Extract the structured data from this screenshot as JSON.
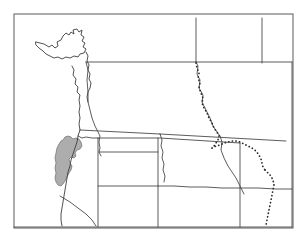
{
  "figure": {
    "kind": "range-map",
    "title": "",
    "caption": "",
    "background_color": "#ffffff",
    "frame": {
      "visible": true,
      "color": "#5a5a5a",
      "x": 14,
      "y": 14,
      "width": 279,
      "height": 214
    }
  },
  "legend": {
    "visible": false,
    "entries": [
      {
        "label": "",
        "symbol": "filled-polygon",
        "color": "#a9a9a9"
      },
      {
        "label": "",
        "symbol": "dotted-line",
        "color": "#2b2b2b"
      }
    ]
  },
  "map": {
    "region_name": "",
    "projection": "",
    "scale_bar": {
      "visible": false,
      "label": ""
    },
    "north_arrow": {
      "visible": false,
      "label": ""
    },
    "labels": [],
    "features": {
      "coastline": {
        "name": "coastline",
        "color": "#3d3d3d",
        "stroke_width": 0.9,
        "paths": [
          "M 36 42 L 44 44 L 49 47 L 52 45 L 55 48 L 58 46 L 57 42 L 61 40 L 63 36 L 66 33 L 69 35 L 71 32 L 74 34 L 73 30 L 77 29 L 79 32 L 82 30 L 81 35 L 84 37 L 82 41 L 85 43 L 83 47 L 86 49 L 84 53 L 80 54 L 78 57 L 74 56 L 70 58 L 66 57 L 62 59 L 58 57 L 54 58 L 50 56 L 46 54 L 43 51 L 39 48 L 36 45 Z",
          "M 72 66 L 74 70 L 73 75 L 76 79 L 75 84 L 78 87 L 77 92 L 80 95 L 79 100 L 80 106 L 79 112 L 80 118 L 79 124 L 80 130",
          "M 86 52 L 88 56 L 87 61 L 89 65 L 88 70 L 90 74 L 89 79 L 91 83 L 90 88 L 88 92 L 87 97 L 88 102",
          "M 80 130 L 78 136 L 77 142 L 75 148 L 73 154 L 71 160 L 70 166 L 68 172 L 67 178 L 66 184 L 65 190 L 64 196 L 63 202 L 62 208 L 61 214 L 61 220 L 62 226"
        ]
      },
      "state_boundaries": {
        "name": "state-boundaries",
        "color": "#4a4a4a",
        "stroke_width": 0.9,
        "paths": [
          "M 86 62 L 110 62 L 140 62 L 170 62 L 196 62",
          "M 196 18 L 196 62",
          "M 196 62 L 230 62 L 262 62 L 292 62",
          "M 262 18 L 262 63",
          "M 196 62 L 198 66 L 197 74 L 200 80 L 199 88 L 203 95 L 202 102 L 206 110 L 210 118 L 213 126 L 217 132 L 220 136",
          "M 86 62 L 88 70 L 87 80 L 88 92 L 88 102 L 90 110 L 92 118 L 95 126 L 98 132 L 100 136 L 99 142 L 100 148 L 99 152 L 101 156",
          "M 80 130 L 100 131 L 120 132 L 140 133 L 160 134",
          "M 160 134 L 162 140 L 161 146 L 163 152 L 162 158 L 164 164 L 163 170 L 165 176 L 164 182",
          "M 78 136 L 82 138 L 86 137 L 92 138 L 98 138",
          "M 98 138 L 98 148 L 98 160 L 98 172 L 98 184 L 98 196 L 98 208 L 98 220 L 98 227",
          "M 98 138 L 112 138 L 128 138 L 144 138 L 160 138 L 176 139 L 192 140 L 208 141 L 224 142 L 240 143",
          "M 158 138 L 158 152 L 158 166 L 158 180 L 158 194 L 158 208 L 158 222 L 158 227",
          "M 160 134 L 178 135 L 196 136 L 214 137 L 232 138 L 250 139 L 268 140 L 286 141",
          "M 292 62 L 292 100 L 292 140 L 292 180 L 292 227",
          "M 220 136 L 222 142 L 221 150 L 224 158 L 228 166 L 232 172 L 236 178 L 240 186 L 244 194",
          "M 240 143 L 240 158 L 240 174 L 240 190 L 240 206 L 240 222 L 240 227",
          "M 98 186 L 112 186 L 126 186 L 140 186 L 154 186 L 158 186",
          "M 158 186 L 174 186 L 190 187 L 206 187 L 222 188 L 238 188 L 240 188",
          "M 240 188 L 258 188 L 276 189 L 292 189",
          "M 60 196 L 70 202 L 78 208 L 86 214 L 92 220 L 96 226",
          "M 14 227 L 98 227 L 158 227 L 240 227 L 292 227",
          "M 99 152 L 110 152 L 122 152 L 134 152 L 146 152 L 158 152"
        ]
      },
      "continental_divide": {
        "name": "continental-divide",
        "style": "dotted",
        "color": "#2b2b2b",
        "stroke_width": 1.7,
        "paths": [
          "M 196 63 L 197 68 L 199 73 L 198 78 L 200 83 L 199 88 L 201 93 L 203 98 L 202 103 L 204 108 L 207 113 L 209 118 L 212 123 L 214 128 L 217 132 L 219 136 L 218 140 L 216 143 L 214 146 L 212 148",
          "M 212 148 L 216 146 L 220 145 L 224 143 L 228 142 L 232 141 L 236 141 L 240 142 L 244 144 L 248 146 L 252 148 L 256 151 L 259 155 L 261 159 L 262 163 L 263 167 L 265 170",
          "M 265 170 L 268 173 L 271 176 L 273 180 L 274 185 L 273 190 L 272 195 L 271 200 L 270 205 L 269 210 L 268 215 L 267 220 L 266 225"
        ]
      },
      "species_range": {
        "name": "species-range-polygon",
        "fill_color": "#a9a9a9",
        "stroke_color": "#6e6e6e",
        "pattern": "stipple",
        "paths": [
          "M 63 140 L 65 137 L 68 136 L 71 137 L 73 139 L 76 138 L 79 139 L 81 142 L 82 146 L 80 149 L 77 150 L 75 153 L 76 156 L 74 158 L 71 157 L 69 159 L 70 163 L 72 166 L 71 170 L 69 173 L 67 177 L 65 181 L 63 184 L 61 186 L 58 185 L 56 182 L 55 178 L 56 173 L 55 168 L 56 163 L 55 158 L 56 153 L 57 148 L 59 144 L 61 141 Z"
        ]
      }
    }
  }
}
